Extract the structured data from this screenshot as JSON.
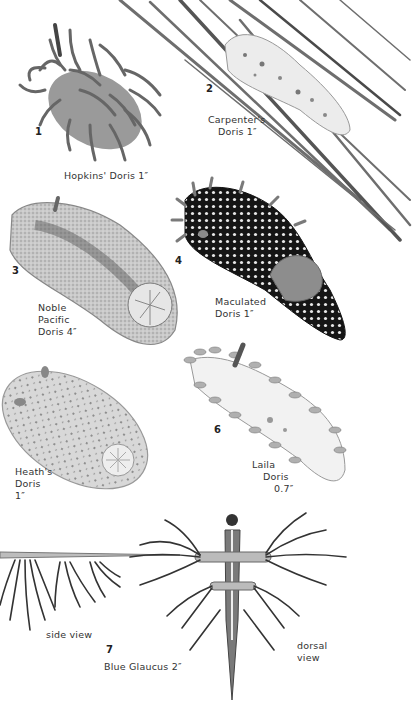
{
  "page": {
    "background": "#ffffff",
    "ink": "#2a2a2a",
    "style": "grayscale field-guide illustration plate"
  },
  "specimens": [
    {
      "number": "1",
      "name_lines": [
        "Hopkins' Doris 1″"
      ],
      "icon": "nudibranch-hopkins-doris"
    },
    {
      "number": "2",
      "name_lines": [
        "Carpenter's",
        "Doris 1″"
      ],
      "icon": "nudibranch-carpenters-doris-on-eelgrass"
    },
    {
      "number": "3",
      "name_lines": [
        "Noble",
        "Pacific",
        "Doris 4″"
      ],
      "icon": "nudibranch-noble-pacific-doris"
    },
    {
      "number": "4",
      "name_lines": [
        "Maculated",
        "Doris 1″"
      ],
      "icon": "nudibranch-maculated-doris"
    },
    {
      "number": "",
      "name_lines": [
        "Heath's",
        "Doris",
        "1″"
      ],
      "icon": "nudibranch-heaths-doris"
    },
    {
      "number": "6",
      "name_lines": [
        "Laila",
        "Doris",
        "0.7″"
      ],
      "icon": "nudibranch-laila-doris"
    },
    {
      "number": "7",
      "name_lines": [
        "Blue Glaucus 2″"
      ],
      "icon": "nudibranch-blue-glaucus",
      "views": [
        {
          "label": "side view"
        },
        {
          "label_lines": [
            "dorsal",
            "view"
          ]
        }
      ]
    }
  ]
}
